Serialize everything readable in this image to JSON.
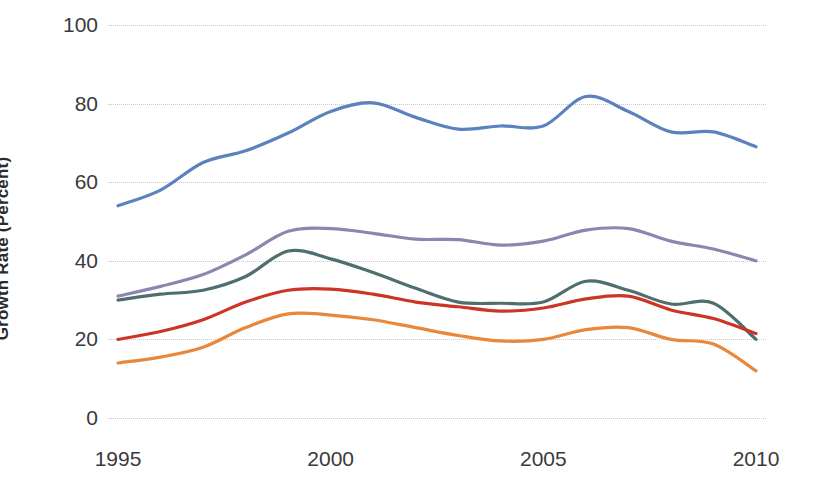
{
  "chart_data": {
    "type": "line",
    "title": "",
    "subtitle": "",
    "xlabel": "",
    "ylabel": "Growth Rate (Percent)",
    "xlim": [
      1995,
      2010
    ],
    "ylim": [
      0,
      100
    ],
    "ytick_labels": [
      "100",
      "80",
      "60",
      "40",
      "20",
      "0"
    ],
    "ytick_values": [
      100,
      80,
      60,
      40,
      20,
      0
    ],
    "xtick_labels": [
      "1995",
      "2000",
      "2005",
      "2010"
    ],
    "xtick_values": [
      1995,
      2000,
      2005,
      2010
    ],
    "grid": "horizontal-dotted",
    "legend": "none",
    "x": [
      1995,
      1996,
      1997,
      1998,
      1999,
      2000,
      2001,
      2002,
      2003,
      2004,
      2005,
      2006,
      2007,
      2008,
      2009,
      2010
    ],
    "series": [
      {
        "name": "series-1-blue",
        "color": "#5b82bf",
        "values": [
          54.0,
          58.0,
          65.0,
          68.0,
          72.5,
          78.0,
          80.2,
          76.5,
          73.5,
          74.3,
          74.3,
          81.8,
          78.0,
          72.8,
          72.8,
          69.0
        ]
      },
      {
        "name": "series-2-purple",
        "color": "#8b86ad",
        "values": [
          31.0,
          33.5,
          36.5,
          41.5,
          47.5,
          48.2,
          47.0,
          45.5,
          45.4,
          44.0,
          45.0,
          47.8,
          48.2,
          45.0,
          43.0,
          40.0
        ]
      },
      {
        "name": "series-3-teal",
        "color": "#4e6f6d",
        "values": [
          30.0,
          31.5,
          32.5,
          36.0,
          42.5,
          40.5,
          37.0,
          33.0,
          29.5,
          29.2,
          29.5,
          34.8,
          32.5,
          29.0,
          29.2,
          20.0
        ]
      },
      {
        "name": "series-4-red",
        "color": "#cc3526",
        "values": [
          20.0,
          22.0,
          25.0,
          29.5,
          32.5,
          32.8,
          31.5,
          29.5,
          28.3,
          27.2,
          28.0,
          30.3,
          31.0,
          27.5,
          25.3,
          21.5
        ]
      },
      {
        "name": "series-5-orange",
        "color": "#e9873b",
        "values": [
          14.0,
          15.5,
          18.0,
          23.0,
          26.5,
          26.2,
          25.0,
          23.0,
          21.0,
          19.6,
          20.0,
          22.5,
          23.0,
          20.0,
          18.8,
          12.0
        ]
      }
    ]
  },
  "axis": {
    "y_title": "Growth Rate (Percent)"
  }
}
